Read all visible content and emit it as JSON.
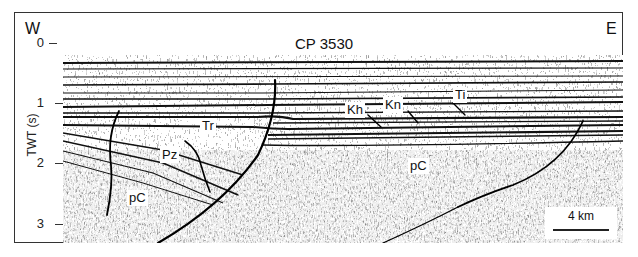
{
  "figure": {
    "title": "CP 3530",
    "west_label": "W",
    "east_label": "E",
    "y_axis": {
      "label": "TWT (s)",
      "ticks": [
        "0",
        "1",
        "2",
        "3"
      ]
    },
    "scale_bar": "4 km",
    "unit_labels": [
      {
        "id": "Ti",
        "text": "Ti"
      },
      {
        "id": "Kn",
        "text": "Kn"
      },
      {
        "id": "Kh",
        "text": "Kh"
      },
      {
        "id": "Tr",
        "text": "Tr"
      },
      {
        "id": "Pz",
        "text": "Pz"
      },
      {
        "id": "pC_west",
        "text": "pC"
      },
      {
        "id": "pC_center",
        "text": "pC"
      }
    ]
  },
  "colors": {
    "ink": "#111111",
    "background": "#ffffff"
  }
}
